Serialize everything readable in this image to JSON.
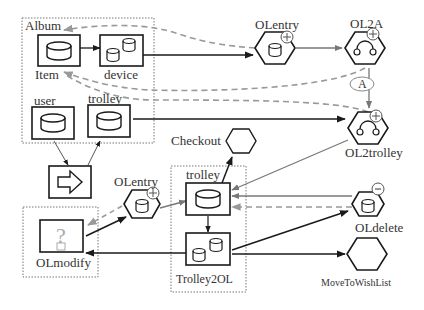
{
  "diagram": {
    "groups": {
      "top_left": {
        "label": "Album"
      },
      "olmodify_group": {},
      "trolley_group": {}
    },
    "nodes": {
      "album_item": {
        "label": "Item",
        "icon": "database-icon"
      },
      "device": {
        "label": "device",
        "icon": "multi-database-icon"
      },
      "user": {
        "label": "user",
        "icon": "database-icon"
      },
      "trolley_top": {
        "label": "trolley",
        "icon": "database-icon"
      },
      "transition": {
        "icon": "right-arrow-icon"
      },
      "olentry_top": {
        "label": "OLentry",
        "icon": "database-icon",
        "badge": "plus"
      },
      "ol2a": {
        "label": "OL2A",
        "icon": "arc-icon",
        "badge": "plus"
      },
      "ol2trolley": {
        "label": "OL2trolley",
        "icon": "arc-icon",
        "badge": "plus"
      },
      "checkout": {
        "label": "Checkout",
        "icon": "hexagon"
      },
      "olentry_bottom": {
        "label": "OLentry",
        "icon": "database-icon",
        "badge": "plus"
      },
      "trolley_bottom": {
        "label": "trolley",
        "icon": "database-icon"
      },
      "trolley2ol": {
        "label": "Trolley2OL",
        "icon": "multi-database-icon"
      },
      "olmodify": {
        "label": "OLmodify",
        "icon": "question-icon"
      },
      "oldelete": {
        "label": "OLdelete",
        "icon": "database-icon",
        "badge": "minus"
      },
      "movetowishlist": {
        "label": "MoveToWishList",
        "icon": "hexagon"
      }
    },
    "annotations": {
      "a_label": "A"
    },
    "colors": {
      "stroke": "#1a1a1a",
      "gray_edge": "#777777",
      "dashed": "#888888",
      "group_border": "#666666"
    }
  }
}
